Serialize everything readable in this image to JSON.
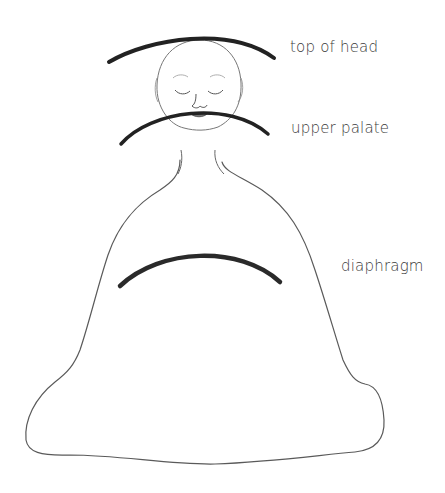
{
  "diagram": {
    "title": "",
    "labels": {
      "top_of_head": "top of head",
      "upper_palate": "upper palate",
      "diaphragm": "diaphragm"
    },
    "elements": [
      {
        "name": "top-of-head-arc",
        "type": "thick-arc"
      },
      {
        "name": "head-outline",
        "type": "circle-sketch"
      },
      {
        "name": "face",
        "features": [
          "closed-eyes",
          "eyebrows",
          "nose",
          "mouth"
        ]
      },
      {
        "name": "upper-palate-arc",
        "type": "thick-arc"
      },
      {
        "name": "body-outline",
        "type": "bell-shaped-seated-figure"
      },
      {
        "name": "diaphragm-arc",
        "type": "thick-arc"
      }
    ],
    "colors": {
      "line": "#555555",
      "arc": "#222222",
      "text": "#3a3a3a",
      "background": "#ffffff"
    }
  }
}
